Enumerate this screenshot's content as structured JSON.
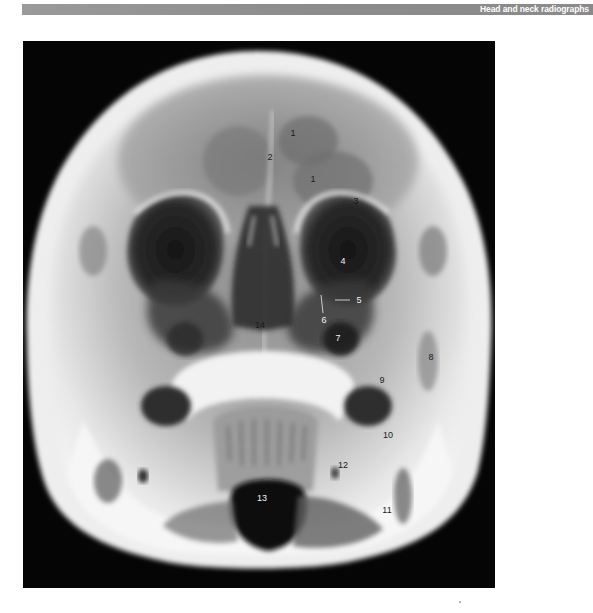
{
  "header": {
    "title": "Head and neck radiographs",
    "bar_color": "#8a8a8a",
    "text_color": "#ffffff"
  },
  "figure": {
    "type": "radiograph",
    "view": "occipitomental skull x-ray",
    "background_color": "#050505",
    "labels": [
      {
        "id": "1a",
        "text": "1",
        "x": 293,
        "y": 133,
        "tone": "dark"
      },
      {
        "id": "2",
        "text": "2",
        "x": 270,
        "y": 157,
        "tone": "dark"
      },
      {
        "id": "1b",
        "text": "1",
        "x": 313,
        "y": 179,
        "tone": "dark"
      },
      {
        "id": "3",
        "text": "3",
        "x": 356,
        "y": 201,
        "tone": "dark"
      },
      {
        "id": "4",
        "text": "4",
        "x": 343,
        "y": 261,
        "tone": "light"
      },
      {
        "id": "5",
        "text": "5",
        "x": 359,
        "y": 300,
        "tone": "light"
      },
      {
        "id": "6",
        "text": "6",
        "x": 324,
        "y": 320,
        "tone": "light"
      },
      {
        "id": "14",
        "text": "14",
        "x": 260,
        "y": 325,
        "tone": "dark"
      },
      {
        "id": "7",
        "text": "7",
        "x": 338,
        "y": 338,
        "tone": "light"
      },
      {
        "id": "8",
        "text": "8",
        "x": 431,
        "y": 357,
        "tone": "dark"
      },
      {
        "id": "9",
        "text": "9",
        "x": 382,
        "y": 380,
        "tone": "dark"
      },
      {
        "id": "10",
        "text": "10",
        "x": 388,
        "y": 435,
        "tone": "dark"
      },
      {
        "id": "12",
        "text": "12",
        "x": 343,
        "y": 465,
        "tone": "dark"
      },
      {
        "id": "13",
        "text": "13",
        "x": 262,
        "y": 498,
        "tone": "light"
      },
      {
        "id": "11",
        "text": "11",
        "x": 387,
        "y": 510,
        "tone": "dark"
      }
    ]
  }
}
